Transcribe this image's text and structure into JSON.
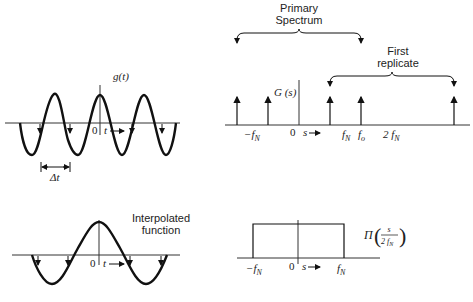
{
  "panels": {
    "top_left": {
      "function_label": "g(t)",
      "origin_label": "0",
      "axis_label": "t",
      "spacing_label": "Δt"
    },
    "top_right": {
      "function_label": "G (s)",
      "origin_label": "0",
      "axis_label": "s",
      "primary_label_line1": "Primary",
      "primary_label_line2": "Spectrum",
      "replicate_label_line1": "First",
      "replicate_label_line2": "replicate",
      "tick_neg_fn": "−f",
      "tick_neg_fn_sub": "N",
      "tick_fn": "f",
      "tick_fn_sub": "N",
      "tick_fo": "f",
      "tick_fo_sub": "o",
      "tick_2fn": "2 f",
      "tick_2fn_sub": "N"
    },
    "bottom_left": {
      "label_line1": "Interpolated",
      "label_line2": "function",
      "origin_label": "0",
      "axis_label": "t"
    },
    "bottom_right": {
      "function_label": "Π",
      "fraction_num": "s",
      "fraction_den": "2 f",
      "fraction_den_sub": "N",
      "origin_label": "0",
      "axis_label": "s",
      "tick_neg_fn": "−f",
      "tick_neg_fn_sub": "N",
      "tick_fn": "f",
      "tick_fn_sub": "N"
    }
  }
}
